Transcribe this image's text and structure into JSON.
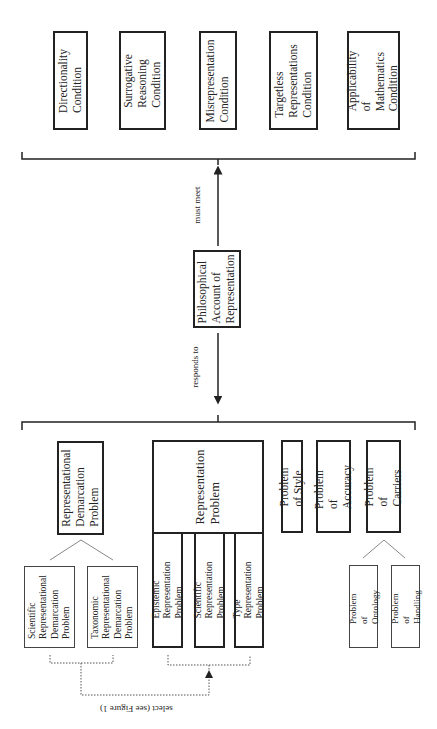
{
  "conditions": [
    {
      "id": "directionality",
      "label": "Directionality\nCondition"
    },
    {
      "id": "surrogative",
      "label": "Surrogative\nReasoning\nCondition"
    },
    {
      "id": "misrepresentation",
      "label": "Misrepresentation\nCondition"
    },
    {
      "id": "targetless",
      "label": "Targetless\nRepresentations\nCondition"
    },
    {
      "id": "applicability",
      "label": "Applicability of\nMathematics\nCondition"
    }
  ],
  "center": {
    "label": "Philosophical\nAccount of\nRepresentation"
  },
  "edges": {
    "must_meet": "must meet",
    "responds_to": "responds to",
    "select": "select (see Figure 1)"
  },
  "problems": {
    "demarcation": {
      "label": "Representational\nDemarcation\nProblem",
      "children": [
        {
          "id": "scientific-rdp",
          "label": "Scientific\nRepresentational\nDemarcation\nProblem"
        },
        {
          "id": "taxonomic-rdp",
          "label": "Taxonomic\nRepresentational\nDemarcation\nProblem"
        }
      ]
    },
    "representation": {
      "label": "Representation\nProblem",
      "children": [
        {
          "id": "epistemic",
          "label": "Epistemic Representation\nProblem"
        },
        {
          "id": "scientific",
          "label": "Scientific Representation\nProblem"
        },
        {
          "id": "type",
          "label": "Type Representation\nProblem"
        }
      ]
    },
    "style": {
      "label": "Problem of Style"
    },
    "accuracy": {
      "label": "Problem of\nAccuracy"
    },
    "carriers": {
      "label": "Problem of\nCarriers",
      "children": [
        {
          "id": "ontology",
          "label": "Problem of\nOntology"
        },
        {
          "id": "handling",
          "label": "Problem of\nHandling"
        }
      ]
    }
  }
}
